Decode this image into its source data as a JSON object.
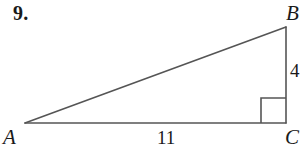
{
  "problem": {
    "number": "9."
  },
  "figure": {
    "type": "right-triangle",
    "stroke_color": "#555555",
    "background_color": "#ffffff",
    "vertices": {
      "A": {
        "label": "A",
        "x": 25,
        "y": 123
      },
      "B": {
        "label": "B",
        "x": 286,
        "y": 27
      },
      "C": {
        "label": "C",
        "x": 286,
        "y": 123
      }
    },
    "sides": {
      "base": {
        "label": "11",
        "from": "A",
        "to": "C"
      },
      "vertical": {
        "label": "4",
        "from": "B",
        "to": "C"
      },
      "hypotenuse": {
        "label": "",
        "from": "A",
        "to": "B"
      }
    },
    "right_angle": {
      "at": "C",
      "marker_size": 25
    }
  }
}
